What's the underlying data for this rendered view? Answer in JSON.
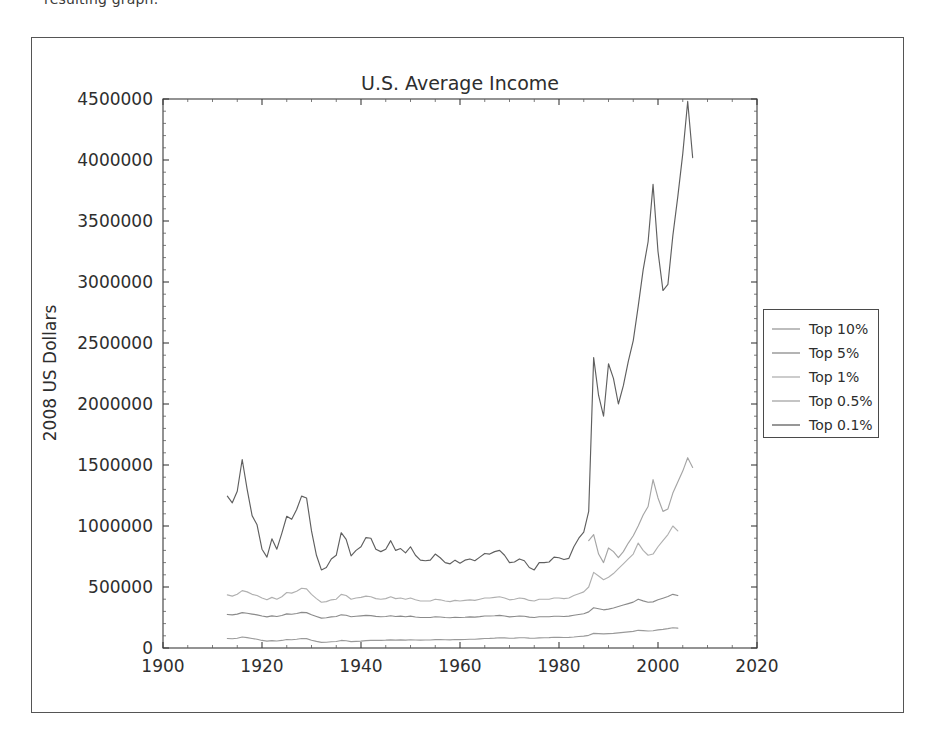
{
  "document": {
    "cropped_text": "resulting graph."
  },
  "figure": {
    "title": "U.S. Average Income",
    "xlabel": "",
    "ylabel": "2008 US Dollars",
    "legend_position": "right-outside"
  },
  "axes": {
    "x_ticks": [
      "1900",
      "1920",
      "1940",
      "1960",
      "1980",
      "2000",
      "2020"
    ],
    "y_ticks": [
      "0",
      "500000",
      "1000000",
      "1500000",
      "2000000",
      "2500000",
      "3000000",
      "3500000",
      "4000000",
      "4500000"
    ],
    "xlim": [
      1900,
      2020
    ],
    "ylim": [
      0,
      4500000
    ]
  },
  "legend": {
    "entries": [
      {
        "label": "Top 10%",
        "color": "#9a9a9a"
      },
      {
        "label": "Top 5%",
        "color": "#8b8b8b"
      },
      {
        "label": "Top 1%",
        "color": "#b0b0b0"
      },
      {
        "label": "Top 0.5%",
        "color": "#a5a5a5"
      },
      {
        "label": "Top 0.1%",
        "color": "#5f5f5f"
      }
    ]
  },
  "chart_data": {
    "type": "line",
    "title": "U.S. Average Income",
    "xlabel": "",
    "ylabel": "2008 US Dollars",
    "xlim": [
      1900,
      2020
    ],
    "ylim": [
      0,
      4500000
    ],
    "grid": false,
    "legend_position": "right-outside",
    "x": [
      1913,
      1914,
      1915,
      1916,
      1917,
      1918,
      1919,
      1920,
      1921,
      1922,
      1923,
      1924,
      1925,
      1926,
      1927,
      1928,
      1929,
      1930,
      1931,
      1932,
      1933,
      1934,
      1935,
      1936,
      1937,
      1938,
      1939,
      1940,
      1941,
      1942,
      1943,
      1944,
      1945,
      1946,
      1947,
      1948,
      1949,
      1950,
      1951,
      1952,
      1953,
      1954,
      1955,
      1956,
      1957,
      1958,
      1959,
      1960,
      1961,
      1962,
      1963,
      1964,
      1965,
      1966,
      1967,
      1968,
      1969,
      1970,
      1971,
      1972,
      1973,
      1974,
      1975,
      1976,
      1977,
      1978,
      1979,
      1980,
      1981,
      1982,
      1983,
      1984,
      1985,
      1986,
      1987,
      1988,
      1989,
      1990,
      1991,
      1992,
      1993,
      1994,
      1995,
      1996,
      1997,
      1998,
      1999,
      2000,
      2001,
      2002,
      2003,
      2004,
      2005,
      2006,
      2007
    ],
    "series": [
      {
        "name": "Top 0.1%",
        "color": "#5f5f5f",
        "values": [
          1245000,
          1190000,
          1285000,
          1545000,
          1300000,
          1085000,
          1010000,
          810000,
          745000,
          895000,
          810000,
          940000,
          1080000,
          1055000,
          1135000,
          1245000,
          1230000,
          960000,
          760000,
          640000,
          660000,
          730000,
          760000,
          945000,
          890000,
          755000,
          800000,
          830000,
          905000,
          900000,
          810000,
          790000,
          810000,
          880000,
          800000,
          815000,
          780000,
          830000,
          760000,
          720000,
          715000,
          720000,
          770000,
          740000,
          700000,
          690000,
          720000,
          695000,
          720000,
          730000,
          715000,
          745000,
          775000,
          770000,
          790000,
          800000,
          760000,
          700000,
          705000,
          730000,
          715000,
          660000,
          640000,
          700000,
          700000,
          705000,
          745000,
          740000,
          725000,
          735000,
          830000,
          900000,
          950000,
          1120000,
          2380000,
          2070000,
          1900000,
          2330000,
          2210000,
          2000000,
          2150000,
          2350000,
          2520000,
          2800000,
          3100000,
          3330000,
          3800000,
          3250000,
          2930000,
          2980000,
          3380000,
          3700000,
          4050000,
          4480000,
          4020000
        ]
      },
      {
        "name": "Top 0.5%",
        "color": "#a5a5a5",
        "values": [
          null,
          null,
          null,
          null,
          null,
          null,
          null,
          null,
          null,
          null,
          null,
          null,
          null,
          null,
          null,
          null,
          null,
          null,
          null,
          null,
          null,
          null,
          null,
          null,
          null,
          null,
          null,
          null,
          null,
          null,
          null,
          null,
          null,
          null,
          null,
          null,
          null,
          null,
          null,
          null,
          null,
          null,
          null,
          null,
          null,
          null,
          null,
          null,
          null,
          null,
          null,
          null,
          null,
          null,
          null,
          null,
          null,
          null,
          null,
          null,
          null,
          null,
          null,
          null,
          null,
          null,
          null,
          null,
          null,
          null,
          null,
          null,
          null,
          880000,
          930000,
          770000,
          700000,
          820000,
          790000,
          740000,
          790000,
          860000,
          920000,
          1000000,
          1090000,
          1160000,
          1380000,
          1230000,
          1120000,
          1140000,
          1270000,
          1360000,
          1450000,
          1560000,
          1480000
        ]
      },
      {
        "name": "Top 1%",
        "color": "#b0b0b0",
        "values": [
          435000,
          425000,
          440000,
          470000,
          460000,
          440000,
          430000,
          410000,
          395000,
          415000,
          400000,
          420000,
          455000,
          450000,
          465000,
          490000,
          485000,
          440000,
          405000,
          375000,
          380000,
          395000,
          400000,
          440000,
          430000,
          400000,
          410000,
          415000,
          425000,
          420000,
          405000,
          400000,
          405000,
          420000,
          405000,
          410000,
          400000,
          410000,
          395000,
          385000,
          385000,
          385000,
          400000,
          395000,
          385000,
          380000,
          390000,
          385000,
          390000,
          395000,
          390000,
          400000,
          410000,
          410000,
          415000,
          420000,
          410000,
          395000,
          400000,
          410000,
          405000,
          390000,
          385000,
          400000,
          400000,
          400000,
          410000,
          410000,
          405000,
          410000,
          430000,
          445000,
          460000,
          500000,
          620000,
          590000,
          560000,
          580000,
          610000,
          650000,
          690000,
          730000,
          770000,
          860000,
          800000,
          760000,
          770000,
          830000,
          880000,
          930000,
          1000000,
          960000,
          null,
          null,
          null
        ]
      },
      {
        "name": "Top 5%",
        "color": "#8b8b8b",
        "values": [
          275000,
          272000,
          278000,
          290000,
          285000,
          278000,
          272000,
          262000,
          255000,
          263000,
          258000,
          266000,
          280000,
          277000,
          283000,
          292000,
          290000,
          272000,
          258000,
          245000,
          248000,
          255000,
          258000,
          272000,
          268000,
          256000,
          260000,
          263000,
          267000,
          265000,
          259000,
          256000,
          258000,
          264000,
          258000,
          261000,
          256000,
          261000,
          254000,
          250000,
          250000,
          250000,
          256000,
          254000,
          250000,
          248000,
          252000,
          250000,
          252000,
          255000,
          253000,
          257000,
          262000,
          262000,
          264000,
          267000,
          262000,
          255000,
          258000,
          262000,
          260000,
          253000,
          250000,
          256000,
          256000,
          256000,
          260000,
          260000,
          258000,
          261000,
          268000,
          275000,
          281000,
          296000,
          330000,
          322000,
          313000,
          319000,
          328000,
          340000,
          352000,
          364000,
          376000,
          400000,
          386000,
          375000,
          378000,
          395000,
          408000,
          422000,
          440000,
          430000,
          null,
          null,
          null
        ]
      },
      {
        "name": "Top 10%",
        "color": "#9a9a9a",
        "values": [
          78000,
          76000,
          80000,
          90000,
          85000,
          78000,
          72000,
          62000,
          56000,
          60000,
          57000,
          62000,
          70000,
          68000,
          72000,
          78000,
          77000,
          64000,
          54000,
          46000,
          47000,
          51000,
          53000,
          62000,
          59000,
          52000,
          54000,
          56000,
          60000,
          62000,
          63000,
          63000,
          64000,
          67000,
          65000,
          67000,
          65000,
          68000,
          66000,
          65000,
          66000,
          66000,
          69000,
          69000,
          68000,
          67000,
          70000,
          69000,
          70000,
          72000,
          72000,
          75000,
          78000,
          79000,
          81000,
          84000,
          83000,
          80000,
          81000,
          84000,
          84000,
          81000,
          80000,
          83000,
          84000,
          85000,
          88000,
          87000,
          86000,
          87000,
          90000,
          94000,
          97000,
          104000,
          120000,
          118000,
          116000,
          118000,
          120000,
          124000,
          128000,
          132000,
          136000,
          145000,
          142000,
          139000,
          141000,
          148000,
          153000,
          159000,
          166000,
          163000,
          null,
          null,
          null
        ]
      }
    ]
  }
}
